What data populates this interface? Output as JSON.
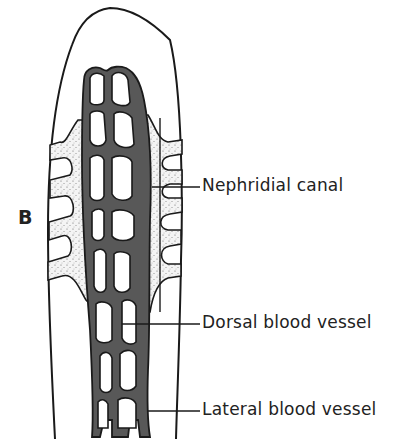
{
  "figure": {
    "panel_label": "B",
    "colors": {
      "outline": "#1a1a1a",
      "vessel_fill": "#555555",
      "canal_fill": "#f2f2f2",
      "background": "#ffffff"
    },
    "labels": [
      {
        "id": "nephridial-canal",
        "text": "Nephridial canal"
      },
      {
        "id": "dorsal-blood-vessel",
        "text": "Dorsal blood vessel"
      },
      {
        "id": "lateral-blood-vessel",
        "text": "Lateral blood vessel"
      }
    ]
  }
}
